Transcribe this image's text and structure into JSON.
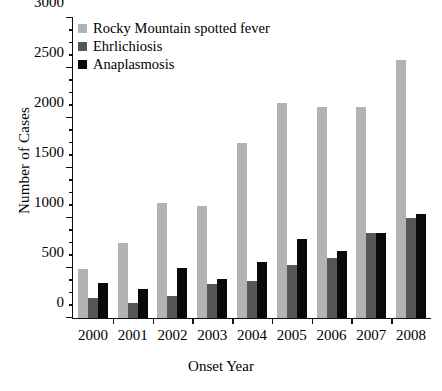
{
  "chart_data": {
    "type": "bar",
    "title": "",
    "xlabel": "Onset Year",
    "ylabel": "Number of Cases",
    "categories": [
      "2000",
      "2001",
      "2002",
      "2003",
      "2004",
      "2005",
      "2006",
      "2007",
      "2008"
    ],
    "series": [
      {
        "name": "Rocky Mountain spotted fever",
        "color": "#b3b3b3",
        "values": [
          495,
          750,
          1150,
          1125,
          1755,
          2155,
          2115,
          2110,
          2580
        ]
      },
      {
        "name": "Ehrlichiosis",
        "color": "#565656",
        "values": [
          200,
          155,
          225,
          340,
          370,
          535,
          600,
          855,
          1000
        ]
      },
      {
        "name": "Anaplasmosis",
        "color": "#0a0a0a",
        "values": [
          350,
          295,
          505,
          390,
          560,
          795,
          670,
          855,
          1045
        ]
      }
    ],
    "ylim": [
      0,
      3000
    ],
    "yticks": [
      0,
      500,
      1000,
      1500,
      2000,
      2500,
      3000
    ],
    "ytick_labels": [
      "0",
      "500",
      "1000",
      "1500",
      "2000",
      "2500",
      "3000"
    ],
    "yminor_step": 125,
    "grid": false,
    "legend_position": "top-left"
  },
  "caption": ""
}
